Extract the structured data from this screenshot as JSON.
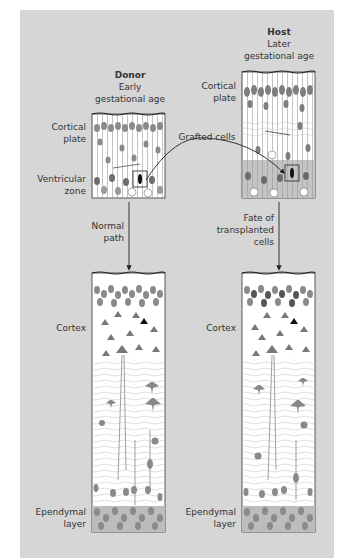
{
  "colors": {
    "panel_bg": "#d6d6d6",
    "box_bg": "#ffffff",
    "cell_gray": "#8a8a8a",
    "cell_dark": "#5a5a5a",
    "ventricular_shade": "#bdbdbd",
    "outline": "#333333",
    "arrow": "#222222"
  },
  "donor": {
    "title": "Donor",
    "subtitle_line1": "Early",
    "subtitle_line2": "gestational age",
    "labels": {
      "cortical_plate_line1": "Cortical",
      "cortical_plate_line2": "plate",
      "ventricular_zone_line1": "Ventricular",
      "ventricular_zone_line2": "zone"
    }
  },
  "host": {
    "title": "Host",
    "subtitle_line1": "Later",
    "subtitle_line2": "gestational age",
    "labels": {
      "cortical_plate_line1": "Cortical",
      "cortical_plate_line2": "plate"
    }
  },
  "transfer": {
    "label": "Grafted cells"
  },
  "arrows": {
    "left_line1": "Normal",
    "left_line2": "path",
    "right_line1": "Fate of",
    "right_line2": "transplanted",
    "right_line3": "cells"
  },
  "result_left": {
    "cortex": "Cortex",
    "ependymal_line1": "Ependymal",
    "ependymal_line2": "layer"
  },
  "result_right": {
    "cortex": "Cortex",
    "ependymal_line1": "Ependymal",
    "ependymal_line2": "layer"
  }
}
